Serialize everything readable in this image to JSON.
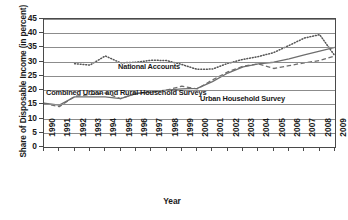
{
  "chart_data": {
    "type": "line",
    "title": "",
    "xlabel": "Year",
    "ylabel": "Share of Disposable Income (in percent)",
    "xlim": [
      1990,
      2009
    ],
    "ylim": [
      0,
      45
    ],
    "ytick_step": 5,
    "grid": true,
    "legend_position": "inline-annotations",
    "x": [
      1990,
      1991,
      1992,
      1993,
      1994,
      1995,
      1996,
      1997,
      1998,
      1999,
      2000,
      2001,
      2002,
      2003,
      2004,
      2005,
      2006,
      2007,
      2008,
      2009
    ],
    "yticks": [
      0,
      5,
      10,
      15,
      20,
      25,
      30,
      35,
      40,
      45
    ],
    "xticks": [
      "1990",
      "1991",
      "1992",
      "1993",
      "1994",
      "1995",
      "1996",
      "1997",
      "1998",
      "1999",
      "2000",
      "2001",
      "2002",
      "2003",
      "2004",
      "2005",
      "2006",
      "2007",
      "2008",
      "2009"
    ],
    "series": [
      {
        "name": "National Accounts",
        "style": "dotted",
        "color": "#555555",
        "values": [
          null,
          null,
          29.3,
          28.8,
          32.0,
          29.6,
          29.8,
          30.5,
          30.4,
          29.0,
          27.3,
          27.4,
          29.4,
          30.8,
          31.8,
          33.2,
          35.7,
          38.3,
          39.5,
          32.0
        ]
      },
      {
        "name": "Combined Urban and Rural Household Surveys",
        "style": "solid",
        "color": "#6e6e6e",
        "values": [
          15.4,
          14.7,
          17.6,
          17.6,
          17.6,
          17.0,
          18.8,
          19.3,
          20.0,
          20.4,
          20.6,
          23.0,
          26.0,
          28.2,
          29.2,
          29.8,
          31.0,
          32.4,
          33.7,
          35.0
        ]
      },
      {
        "name": "Urban Household Survey",
        "style": "dashed",
        "color": "#6e6e6e",
        "values": [
          15.3,
          14.2,
          17.8,
          18.4,
          19.0,
          17.0,
          18.8,
          19.4,
          20.0,
          21.4,
          20.4,
          23.6,
          26.4,
          28.4,
          29.2,
          27.6,
          28.6,
          29.6,
          30.4,
          32.0
        ]
      }
    ],
    "annotations": [
      {
        "name": "national-accounts",
        "text": "National Accounts"
      },
      {
        "name": "combined",
        "text": "Combined Urban and Rural Household Surveys"
      },
      {
        "name": "urban",
        "text": "Urban Household Survey"
      }
    ]
  }
}
